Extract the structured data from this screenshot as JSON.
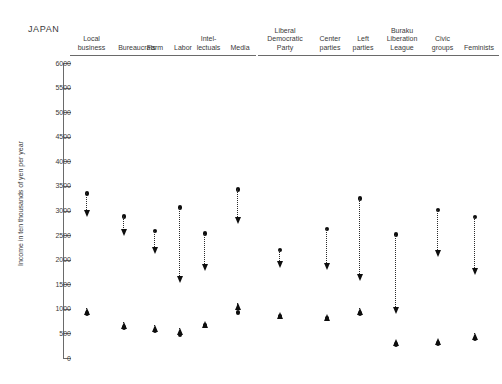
{
  "chart": {
    "country_label": "JAPAN",
    "y_axis_title": "Income in ten thousands of yen per year"
  },
  "chart_data": {
    "type": "scatter",
    "title": "JAPAN",
    "subtitle": "",
    "xlabel": "",
    "ylabel": "Income in ten thousands of yen per year",
    "ylim": [
      0,
      6000
    ],
    "ytick_labels": [
      "6000",
      "5500",
      "5000",
      "4500",
      "4000",
      "3500",
      "3000",
      "2500",
      "2000",
      "1500",
      "1000",
      "500",
      "0"
    ],
    "ytick_values": [
      6000,
      5500,
      5000,
      4500,
      4000,
      3500,
      3000,
      2500,
      2000,
      1500,
      1000,
      500,
      0
    ],
    "grid": false,
    "legend": "none",
    "categories": [
      "Local business",
      "Bureaucrats",
      "Farm",
      "Labor",
      "Intel-\nlectuals",
      "Media",
      "Liberal\nDemocratic\nParty",
      "Center\nparties",
      "Left\nparties",
      "Buraku\nLiberation\nLeague",
      "Civic\ngroups",
      "Feminists"
    ],
    "series": [
      {
        "name": "Perceived income (upper estimate)",
        "marker": "dot",
        "values": [
          3350,
          2880,
          2580,
          3060,
          2530,
          3430,
          2200,
          2620,
          3250,
          2510,
          3010,
          2870
        ]
      },
      {
        "name": "Target income (downward arrow tip)",
        "marker": "arrow-down",
        "values": [
          2860,
          2470,
          2120,
          1520,
          1760,
          2720,
          1830,
          1790,
          1560,
          900,
          2060,
          1690
        ]
      },
      {
        "name": "Perceived income (lower estimate)",
        "marker": "dot",
        "values": [
          900,
          620,
          550,
          480,
          660,
          930,
          850,
          810,
          900,
          280,
          300,
          390
        ]
      },
      {
        "name": "Target income (upward arrow tip)",
        "marker": "arrow-up",
        "values": [
          1010,
          740,
          670,
          620,
          760,
          1120,
          940,
          890,
          1010,
          380,
          400,
          500
        ]
      }
    ],
    "groups": [
      {
        "category": "Local business",
        "x_px": 87,
        "upper_dot": 3350,
        "upper_arrow": 2860,
        "lower_dot": 900,
        "lower_arrow": 1010
      },
      {
        "category": "Bureaucrats",
        "x_px": 124,
        "upper_dot": 2880,
        "upper_arrow": 2470,
        "lower_dot": 620,
        "lower_arrow": 740
      },
      {
        "category": "Farm",
        "x_px": 155,
        "upper_dot": 2580,
        "upper_arrow": 2120,
        "lower_dot": 550,
        "lower_arrow": 670
      },
      {
        "category": "Labor",
        "x_px": 180,
        "upper_dot": 3060,
        "upper_arrow": 1520,
        "lower_dot": 480,
        "lower_arrow": 620
      },
      {
        "category": "Intel-lectuals",
        "x_px": 205,
        "upper_dot": 2530,
        "upper_arrow": 1760,
        "lower_dot": 660,
        "lower_arrow": 760
      },
      {
        "category": "Media",
        "x_px": 238,
        "upper_dot": 3430,
        "upper_arrow": 2720,
        "lower_dot": 930,
        "lower_arrow": 1120
      },
      {
        "category": "Liberal Democratic Party",
        "x_px": 280,
        "upper_dot": 2200,
        "upper_arrow": 1830,
        "lower_dot": 850,
        "lower_arrow": 940
      },
      {
        "category": "Center parties",
        "x_px": 327,
        "upper_dot": 2620,
        "upper_arrow": 1790,
        "lower_dot": 810,
        "lower_arrow": 890
      },
      {
        "category": "Left parties",
        "x_px": 360,
        "upper_dot": 3250,
        "upper_arrow": 1560,
        "lower_dot": 900,
        "lower_arrow": 1010
      },
      {
        "category": "Buraku Liberation League",
        "x_px": 396,
        "upper_dot": 2510,
        "upper_arrow": 900,
        "lower_dot": 280,
        "lower_arrow": 380
      },
      {
        "category": "Civic groups",
        "x_px": 438,
        "upper_dot": 3010,
        "upper_arrow": 2060,
        "lower_dot": 300,
        "lower_arrow": 400
      },
      {
        "category": "Feminists",
        "x_px": 475,
        "upper_dot": 2870,
        "upper_arrow": 1690,
        "lower_dot": 390,
        "lower_arrow": 500
      }
    ]
  },
  "headers": [
    {
      "label": "Local\nbusiness",
      "left": 70,
      "width": 43
    },
    {
      "label": "Bureaucrats",
      "left": 113,
      "width": 48
    },
    {
      "label": "Farm",
      "left": 141,
      "width": 28
    },
    {
      "label": "Labor",
      "left": 169,
      "width": 28
    },
    {
      "label": "Intel-\nlectuals",
      "left": 190,
      "width": 37
    },
    {
      "label": "Media",
      "left": 224,
      "width": 32
    },
    {
      "label": "Liberal\nDemocratic\nParty",
      "left": 258,
      "width": 54
    },
    {
      "label": "Center\nparties",
      "left": 312,
      "width": 36
    },
    {
      "label": "Left\nparties",
      "left": 348,
      "width": 30
    },
    {
      "label": "Buraku\nLiberation\nLeague",
      "left": 378,
      "width": 48
    },
    {
      "label": "Civic\ngroups",
      "left": 426,
      "width": 33
    },
    {
      "label": "Feminists",
      "left": 459,
      "width": 40
    }
  ]
}
